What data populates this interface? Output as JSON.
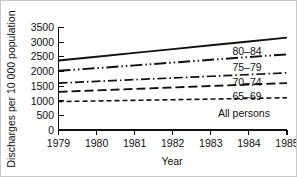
{
  "figure": {
    "background_color": "#ffffff",
    "border_color": "#c8c8c8",
    "line_color": "#111111"
  },
  "chart_data": {
    "type": "line",
    "title": "",
    "subtitle": "",
    "xlabel": "Year",
    "ylabel": "Discharges per 10 000 population",
    "x": [
      1979,
      1980,
      1981,
      1982,
      1983,
      1984,
      1985
    ],
    "xtick_labels": [
      "1979",
      "1980",
      "1981",
      "1982",
      "1983",
      "1984",
      "1985"
    ],
    "ytick_labels": [
      "0",
      "500",
      "1000",
      "1500",
      "2000",
      "2500",
      "3000",
      "3500"
    ],
    "ytick_values": [
      0,
      500,
      1000,
      1500,
      2000,
      2500,
      3000,
      3500
    ],
    "xlim": [
      1979,
      1985
    ],
    "ylim": [
      0,
      3500
    ],
    "grid": false,
    "legend_position": "inline-right-of-line-ends",
    "series": [
      {
        "name": "80-84",
        "label": "80–84",
        "style": "solid",
        "dash": "none",
        "width": 1.9,
        "color": "#111111",
        "values": [
          2370,
          2500,
          2630,
          2760,
          2890,
          3020,
          3150
        ]
      },
      {
        "name": "75-79",
        "label": "75–79",
        "style": "long-dash-dot-dot",
        "dash": "12,3,1.5,3,1.5,3",
        "width": 1.9,
        "color": "#111111",
        "values": [
          2020,
          2110,
          2205,
          2300,
          2395,
          2490,
          2580
        ]
      },
      {
        "name": "70-74",
        "label": "70–74",
        "style": "dash-dot",
        "dash": "9,3,1.5,3",
        "width": 1.7,
        "color": "#111111",
        "values": [
          1600,
          1660,
          1718,
          1775,
          1833,
          1890,
          1950
        ]
      },
      {
        "name": "65-69",
        "label": "65–69",
        "style": "long-dash",
        "dash": "9,4",
        "width": 1.9,
        "color": "#111111",
        "values": [
          1300,
          1350,
          1400,
          1450,
          1500,
          1550,
          1600
        ]
      },
      {
        "name": "All persons",
        "label": "All persons",
        "style": "short-dash",
        "dash": "5,3",
        "width": 1.6,
        "color": "#111111",
        "values": [
          970,
          990,
          1012,
          1033,
          1055,
          1078,
          1100
        ]
      }
    ]
  }
}
